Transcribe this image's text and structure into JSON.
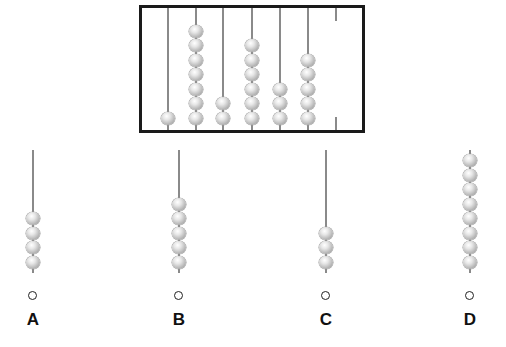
{
  "abacus": {
    "rods": [
      {
        "x": 168,
        "beads": 1
      },
      {
        "x": 196,
        "beads": 7
      },
      {
        "x": 223,
        "beads": 2
      },
      {
        "x": 252,
        "beads": 6
      },
      {
        "x": 280,
        "beads": 3
      },
      {
        "x": 308,
        "beads": 5
      },
      {
        "x": 336,
        "beads": 0,
        "partial": true
      }
    ]
  },
  "options": [
    {
      "label": "A",
      "x": 33,
      "beads": 4
    },
    {
      "label": "B",
      "x": 179,
      "beads": 5
    },
    {
      "label": "C",
      "x": 326,
      "beads": 3
    },
    {
      "label": "D",
      "x": 470,
      "beads": 8
    }
  ],
  "colors": {
    "frame": "#1a1a1a",
    "rod": "#8a8a8a",
    "bead": "#c8c8c8"
  }
}
